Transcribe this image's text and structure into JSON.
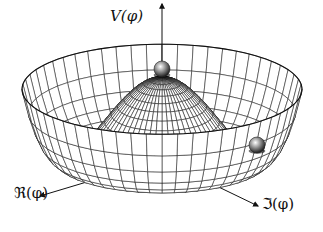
{
  "figure": {
    "labels": {
      "vertical_axis": "V(φ)",
      "real_axis": "ℜ(φ)",
      "imag_axis": "ℑ(φ)"
    },
    "objects": [
      {
        "name": "ball-at-peak",
        "description": "unstable equilibrium at top of hump",
        "cx": 162,
        "cy": 69,
        "r": 8
      },
      {
        "name": "ball-in-trough",
        "description": "ball resting in circular minimum",
        "cx": 257,
        "cy": 145,
        "r": 8
      }
    ],
    "surface": {
      "center_x": 162,
      "base_y": 150,
      "radius_x": 140,
      "radius_y": 45,
      "hump_height": 82,
      "rim_height": 22,
      "radial_lines": 56,
      "rings": 22,
      "line_color": "#1a1a1a"
    },
    "axes": {
      "vertical": {
        "x1": 162,
        "y1": 150,
        "x2": 162,
        "y2": 4
      },
      "real": {
        "x1": 100,
        "y1": 178,
        "x2": 40,
        "y2": 196
      },
      "imag": {
        "x1": 200,
        "y1": 178,
        "x2": 258,
        "y2": 206
      }
    }
  }
}
